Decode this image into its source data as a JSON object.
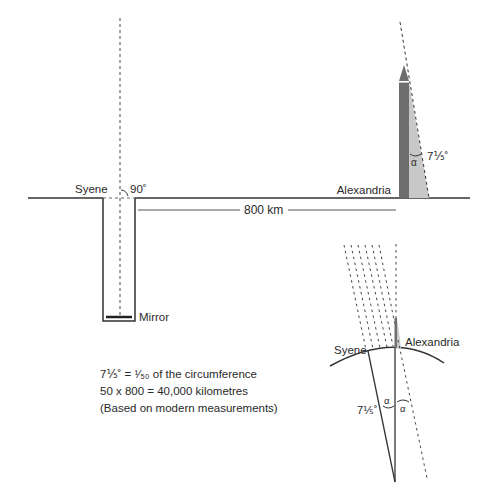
{
  "diagram": {
    "top": {
      "syene_label": "Syene",
      "angle_90_label": "90˚",
      "alexandria_label": "Alexandria",
      "distance_label": "800 km",
      "shadow_angle_symbol": "α",
      "shadow_angle_label": "7⅕˚",
      "mirror_label": "Mirror"
    },
    "bottom": {
      "syene_label": "Syene",
      "alexandria_label": "Alexandria",
      "center_angle_label": "7⅕˚",
      "alpha_left": "α",
      "alpha_right": "α"
    },
    "notes": [
      "7⅕˚ = ¹⁄₅₀ of the circumference",
      "50 x 800 = 40,000 kilometres",
      "(Based on modern measurements)"
    ],
    "colors": {
      "line": "#333333",
      "obelisk": "#6e6e6e",
      "shadow": "#c8c8c8"
    }
  }
}
